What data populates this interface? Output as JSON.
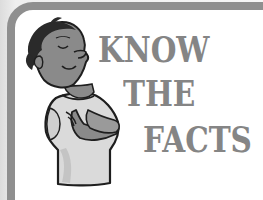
{
  "illustration": {
    "headline": {
      "lines": [
        "KNOW",
        "THE",
        "FACTS"
      ]
    },
    "character": {
      "description": "cartoon boy with crossed arms, eyes closed, looking upward confidently",
      "icon": "boy-illustration"
    },
    "frame": {
      "style": "rounded gray border panel"
    },
    "colors": {
      "frame_border": "#8f8f8f",
      "headline_text": "#858585",
      "panel_background": "#ffffff",
      "skin": "#8a8a8a",
      "hair": "#2a2a2a",
      "shirt": "#d9d9d9",
      "outline": "#1e1e1e"
    }
  }
}
